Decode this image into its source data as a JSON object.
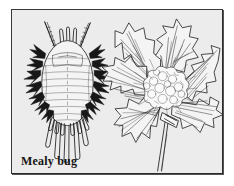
{
  "figure": {
    "caption": "Mealy bug",
    "medium": "pen-and-ink line illustration",
    "background_color": "#ececec",
    "ink_color": "#1a1a1a",
    "frame_color": "#3a3a3a",
    "page_color": "#ffffff",
    "panels": [
      {
        "id": "specimen",
        "name": "mealy-bug-specimen",
        "label": "Mealy bug",
        "description": "Dorsal view of an adult mealy bug: oval segmented body with marginal wax filaments, paired antennae and long caudal filaments.",
        "parts": [
          "antennae",
          "head-spines",
          "segmented-abdomen",
          "marginal-wax-filaments",
          "caudal-filaments"
        ]
      },
      {
        "id": "host-plant",
        "name": "infested-plant-sprig",
        "label": "",
        "description": "Sprig of a host plant with serrated leaves radiating from a central node, showing a white cottony mealy bug colony at the leaf axils, with stem below.",
        "parts": [
          "serrated-leaves",
          "leaf-veins",
          "mealy-bug-colony-mass",
          "stem"
        ]
      }
    ]
  }
}
